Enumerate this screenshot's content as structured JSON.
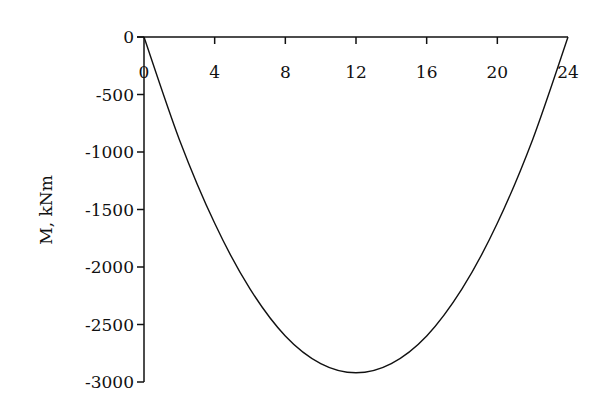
{
  "chart_data": {
    "type": "line",
    "title": "",
    "xlabel": "",
    "ylabel": "M, kNm",
    "xlim": [
      0,
      24
    ],
    "ylim": [
      -3000,
      0
    ],
    "x_ticks": [
      0,
      4,
      8,
      12,
      16,
      20,
      24
    ],
    "y_ticks": [
      0,
      -500,
      -1000,
      -1500,
      -2000,
      -2500,
      -3000
    ],
    "grid": false,
    "legend": null,
    "series": [
      {
        "name": "Bending moment",
        "color": "#111111",
        "x": [
          0,
          2,
          4,
          6,
          8,
          10,
          12,
          14,
          16,
          18,
          20,
          22,
          24
        ],
        "values": [
          0,
          -890,
          -1620,
          -2190,
          -2600,
          -2840,
          -2920,
          -2840,
          -2600,
          -2190,
          -1620,
          -890,
          0
        ]
      }
    ]
  }
}
